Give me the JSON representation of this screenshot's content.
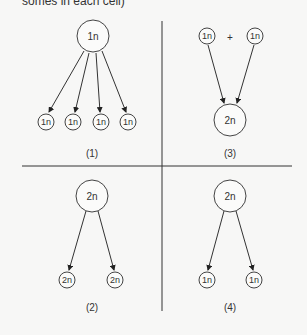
{
  "caption": "somes in each cell)",
  "colors": {
    "line": "#333333",
    "node_stroke": "#444444",
    "background": "#f7f7f6"
  },
  "panels": [
    {
      "id": "1",
      "label": "(1)",
      "description": "One 1n cell divides into four 1n cells",
      "source_nodes": [
        {
          "label": "1n",
          "size": "large"
        }
      ],
      "target_nodes": [
        {
          "label": "1n",
          "size": "small"
        },
        {
          "label": "1n",
          "size": "small"
        },
        {
          "label": "1n",
          "size": "small"
        },
        {
          "label": "1n",
          "size": "small"
        }
      ]
    },
    {
      "id": "2",
      "label": "(2)",
      "description": "One 2n cell divides into two 2n cells",
      "source_nodes": [
        {
          "label": "2n",
          "size": "large"
        }
      ],
      "target_nodes": [
        {
          "label": "2n",
          "size": "small"
        },
        {
          "label": "2n",
          "size": "small"
        }
      ]
    },
    {
      "id": "3",
      "label": "(3)",
      "description": "Two 1n cells fuse into one 2n cell",
      "operator": "+",
      "source_nodes": [
        {
          "label": "1n",
          "size": "small"
        },
        {
          "label": "1n",
          "size": "small"
        }
      ],
      "target_nodes": [
        {
          "label": "2n",
          "size": "large"
        }
      ]
    },
    {
      "id": "4",
      "label": "(4)",
      "description": "One 2n cell divides into two 1n cells",
      "source_nodes": [
        {
          "label": "2n",
          "size": "large"
        }
      ],
      "target_nodes": [
        {
          "label": "1n",
          "size": "small"
        },
        {
          "label": "1n",
          "size": "small"
        }
      ]
    }
  ]
}
